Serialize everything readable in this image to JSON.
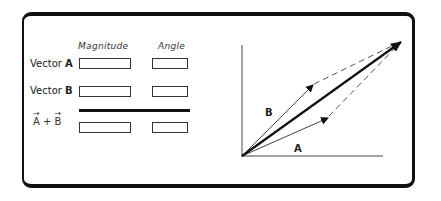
{
  "headers": {
    "magnitude": "Magnitude",
    "angle": "Angle"
  },
  "rows": [
    {
      "prefix": "Vector ",
      "vector": "A",
      "magnitude": "",
      "angle": ""
    },
    {
      "prefix": "Vector ",
      "vector": "B",
      "magnitude": "",
      "angle": ""
    }
  ],
  "sum": {
    "a": "A",
    "plus": " + ",
    "b": "B",
    "arrow": "→",
    "magnitude": "",
    "angle": ""
  },
  "graph": {
    "label_a": "A",
    "label_b": "B",
    "origin": [
      242,
      156
    ],
    "tip_a": [
      327,
      118
    ],
    "tip_b": [
      312,
      85
    ],
    "tip_resultant": [
      400,
      42
    ]
  }
}
